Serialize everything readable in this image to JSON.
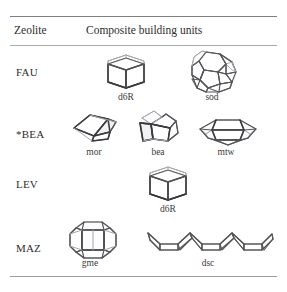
{
  "caption_fragment": "",
  "table": {
    "columns": [
      {
        "key": "zeolite",
        "label": "Zeolite"
      },
      {
        "key": "cbu",
        "label": "Composite building units"
      }
    ],
    "rows": [
      {
        "zeolite": "FAU",
        "units": [
          {
            "name": "d6R",
            "shape": "hexagonal-prism"
          },
          {
            "name": "sod",
            "shape": "truncated-octahedron"
          }
        ]
      },
      {
        "zeolite": "*BEA",
        "units": [
          {
            "name": "mor",
            "shape": "mor-cage"
          },
          {
            "name": "bea",
            "shape": "bea-cage"
          },
          {
            "name": "mtw",
            "shape": "mtw-cage"
          }
        ]
      },
      {
        "zeolite": "LEV",
        "units": [
          {
            "name": "d6R",
            "shape": "hexagonal-prism"
          }
        ]
      },
      {
        "zeolite": "MAZ",
        "units": [
          {
            "name": "gme",
            "shape": "gmelinite-cage"
          },
          {
            "name": "dsc",
            "shape": "double-sawtooth-chain"
          }
        ]
      }
    ]
  },
  "colors": {
    "rule": "#8d8f93",
    "edge_dark": "#3a3a3e",
    "edge_mid": "#545458",
    "edge_light": "#a8a8ac",
    "text": "#2b2b2b",
    "background": "#ffffff"
  }
}
